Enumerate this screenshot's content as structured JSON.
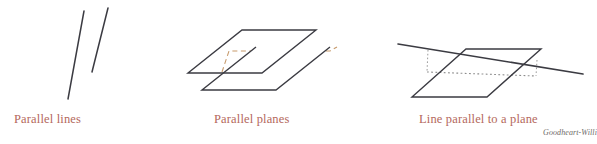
{
  "figure": {
    "background_color": "#ffffff",
    "stroke_color": "#3b3b42",
    "hidden_edge_color": "#c79a6b",
    "dotted_edge_color": "#8d8d8d",
    "caption_color": "#b4685c",
    "credit_color": "#6d6a67"
  },
  "captions": {
    "parallel_lines": "Parallel lines",
    "parallel_planes": "Parallel planes",
    "line_parallel_to_plane": "Line parallel to a plane"
  },
  "credit": {
    "text": "Goodheart-Willi"
  },
  "diagram_data": {
    "type": "geometry-illustration",
    "panels": [
      {
        "id": "parallel-lines",
        "caption": "Parallel lines",
        "elements": [
          {
            "name": "line-left",
            "kind": "segment",
            "x1": 84,
            "y1": 11,
            "x2": 68,
            "y2": 99
          },
          {
            "name": "line-right",
            "kind": "segment",
            "x1": 108,
            "y1": 8,
            "x2": 92,
            "y2": 72
          }
        ]
      },
      {
        "id": "parallel-planes",
        "caption": "Parallel planes",
        "elements": [
          {
            "name": "upper-plane",
            "kind": "parallelogram",
            "points": "242,30 316,30 262,73 188,73",
            "visible_edges": [
              {
                "x1": 242,
                "y1": 30,
                "x2": 316,
                "y2": 30
              },
              {
                "x1": 316,
                "y1": 30,
                "x2": 262,
                "y2": 73
              },
              {
                "x1": 262,
                "y1": 73,
                "x2": 188,
                "y2": 73
              },
              {
                "x1": 188,
                "y1": 73,
                "x2": 242,
                "y2": 30
              }
            ]
          },
          {
            "name": "lower-plane",
            "kind": "parallelogram",
            "points": "256,47 330,47 276,90 202,90",
            "visible_edges": [
              {
                "x1": 330,
                "y1": 47,
                "x2": 276,
                "y2": 90
              },
              {
                "x1": 276,
                "y1": 90,
                "x2": 202,
                "y2": 90
              },
              {
                "x1": 202,
                "y1": 90,
                "x2": 256,
                "y2": 47
              }
            ]
          },
          {
            "name": "hidden-edge-dashed",
            "kind": "dashed-path",
            "path": "M 222,72 L 229,51 L 330,51 L 337,47"
          }
        ]
      },
      {
        "id": "line-parallel-to-a-plane",
        "caption": "Line parallel to a plane",
        "elements": [
          {
            "name": "plane",
            "kind": "parallelogram",
            "points": "466,49 541,49 487,97 412,97"
          },
          {
            "name": "parallel-line",
            "kind": "segment",
            "x1": 398,
            "y1": 44,
            "x2": 583,
            "y2": 74
          },
          {
            "name": "projection-line-dotted",
            "kind": "dotted-segment",
            "x1": 427,
            "y1": 72,
            "x2": 536,
            "y2": 76
          },
          {
            "name": "dropper-left-dotted",
            "kind": "dotted-segment",
            "x1": 428,
            "y1": 50,
            "x2": 427,
            "y2": 72
          },
          {
            "name": "dropper-right-dotted",
            "kind": "dotted-segment",
            "x1": 537,
            "y1": 60,
            "x2": 536,
            "y2": 76
          }
        ]
      }
    ]
  }
}
